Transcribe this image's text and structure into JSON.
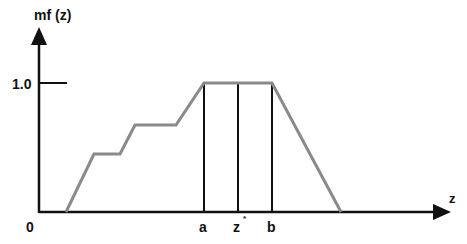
{
  "diagram": {
    "type": "fuzzy membership function",
    "y_axis_label": "mf (z)",
    "x_axis_label": "z",
    "origin_label": "0",
    "y_tick_label": "1.0",
    "x_markers": [
      {
        "label": "a",
        "x": 204
      },
      {
        "label": "z",
        "superscript": "*",
        "x": 238
      },
      {
        "label": "b",
        "x": 272
      }
    ],
    "curve_points": "66,212 94,154 120,154 135,125 176,125 204,83 272,83 341,212",
    "colors": {
      "axis": "#111111",
      "curve": "#8a8a8a",
      "marker_lines": "#111111"
    }
  }
}
